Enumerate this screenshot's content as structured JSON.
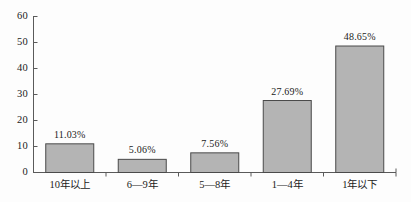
{
  "chart_data": {
    "type": "bar",
    "title": "",
    "subtitle": "",
    "xlabel": "",
    "ylabel": "",
    "categories": [
      "10年以上",
      "6—9年",
      "5—8年",
      "1—4年",
      "1年以下"
    ],
    "values": [
      11.03,
      5.06,
      7.56,
      27.69,
      48.65
    ],
    "point_labels": [
      "11.03%",
      "5.06%",
      "7.56%",
      "27.69%",
      "48.65%"
    ],
    "series": [
      {
        "name": "",
        "values": [
          11.03,
          5.06,
          7.56,
          27.69,
          48.65
        ]
      }
    ],
    "ylim": [
      0,
      60
    ],
    "yticks": [
      0,
      10,
      20,
      30,
      40,
      50,
      60
    ],
    "ytick_labels": [
      "0",
      "10",
      "20",
      "30",
      "40",
      "50",
      "60"
    ],
    "grid": false,
    "legend": "none",
    "bar_fill_color": "#b4b4b4",
    "bar_edge_color": "#4a4a4a",
    "axis_color": "#5a5a5a",
    "background_color": "#fdfdfd"
  }
}
